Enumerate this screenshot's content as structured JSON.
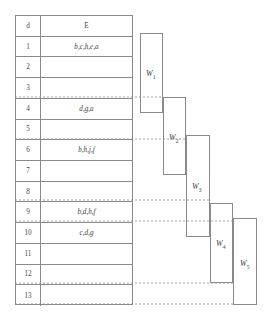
{
  "diagram": {
    "table": {
      "header": {
        "index": "d",
        "value": "E"
      },
      "rows": [
        {
          "index": "1",
          "value": "b,c,h,e,a"
        },
        {
          "index": "2",
          "value": ""
        },
        {
          "index": "3",
          "value": ""
        },
        {
          "index": "4",
          "value": "d,g,a"
        },
        {
          "index": "5",
          "value": ""
        },
        {
          "index": "6",
          "value": "b,h,j,f"
        },
        {
          "index": "7",
          "value": ""
        },
        {
          "index": "8",
          "value": ""
        },
        {
          "index": "9",
          "value": "b,d,h,f"
        },
        {
          "index": "10",
          "value": "c,d,g"
        },
        {
          "index": "11",
          "value": ""
        },
        {
          "index": "12",
          "value": ""
        },
        {
          "index": "13",
          "value": ""
        }
      ]
    },
    "boxes": [
      {
        "name": "W",
        "sub": "1",
        "x": 140,
        "y": 33,
        "w": 23,
        "h": 80,
        "label_x": 146,
        "label_y": 69
      },
      {
        "name": "W",
        "sub": "2",
        "x": 163,
        "y": 97,
        "w": 23,
        "h": 78,
        "label_x": 169,
        "label_y": 133
      },
      {
        "name": "W",
        "sub": "3",
        "x": 186,
        "y": 135,
        "w": 24,
        "h": 102,
        "label_x": 192,
        "label_y": 182
      },
      {
        "name": "W",
        "sub": "4",
        "x": 210,
        "y": 203,
        "w": 23,
        "h": 80,
        "label_x": 216,
        "label_y": 239
      },
      {
        "name": "W",
        "sub": "5",
        "x": 233,
        "y": 218,
        "w": 24,
        "h": 87,
        "label_x": 240,
        "label_y": 259
      }
    ],
    "connectors": [
      {
        "from_x": 15,
        "to_x": 163,
        "y": 97
      },
      {
        "from_x": 15,
        "to_x": 186,
        "y": 139
      },
      {
        "from_x": 15,
        "to_x": 210,
        "y": 200
      },
      {
        "from_x": 15,
        "to_x": 233,
        "y": 221
      },
      {
        "from_x": 15,
        "to_x": 233,
        "y": 283
      },
      {
        "from_x": 15,
        "to_x": 233,
        "y": 304
      }
    ],
    "colors": {
      "line": "#8a8a8a",
      "text": "#3d3d3d",
      "background": "#ffffff"
    }
  }
}
